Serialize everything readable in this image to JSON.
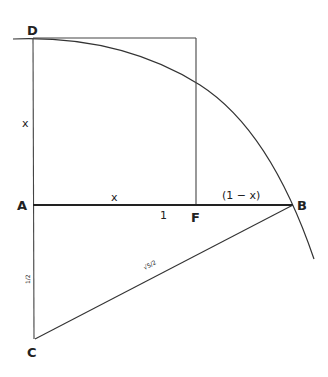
{
  "diagram": {
    "points": {
      "D": {
        "label": "D",
        "x": 33,
        "y": 38
      },
      "A": {
        "label": "A",
        "x": 33,
        "y": 205
      },
      "F": {
        "label": "F",
        "x": 196,
        "y": 205
      },
      "B": {
        "label": "B",
        "x": 293,
        "y": 205
      },
      "C": {
        "label": "C",
        "x": 35,
        "y": 339
      }
    },
    "segment_labels": {
      "AD": "x",
      "AF": "x",
      "unit_mark": "1",
      "FB": "(1 − x)",
      "AC": "1/2",
      "CB": "√5/2"
    },
    "stroke_color": "#333333",
    "background": "#ffffff"
  }
}
